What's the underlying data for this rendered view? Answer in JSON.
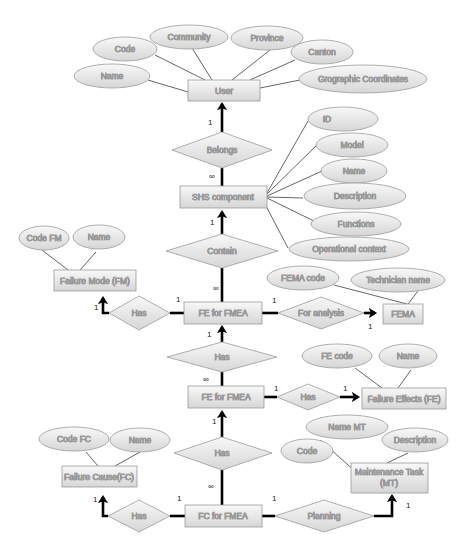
{
  "diagram": {
    "type": "entity-relationship",
    "colors": {
      "fill_top": "#f7f7f7",
      "fill_bottom": "#d9d9d9",
      "stroke": "#9a9a9a",
      "line": "#555555",
      "thick_line": "#000000"
    },
    "entities": {
      "user": "User",
      "shs_component": "SHS component",
      "failure_mode": "Failure Mode (FM)",
      "fe_for_fmea_1": "FE for FMEA",
      "fema": "FEMA",
      "fe_for_fmea_2": "FE for FMEA",
      "failure_effects": "Failure Effects (FE)",
      "failure_cause": "Failure Cause(FC)",
      "fc_for_fmea": "FC for FMEA",
      "maintenance_task_line1": "Maintenance Task",
      "maintenance_task_line2": "(MT)"
    },
    "relationships": {
      "belongs": "Belongs",
      "contain": "Contain",
      "has_fm": "Has",
      "for_analysis": "For analysis",
      "has_fe_mid": "Has",
      "has_fe": "Has",
      "has_fc_mid": "Has",
      "has_fc": "Has",
      "planning": "Planning"
    },
    "attributes": {
      "user": {
        "code": "Code",
        "community": "Community",
        "province": "Province",
        "canton": "Canton",
        "name": "Name",
        "coords": "Grographic Coordinates"
      },
      "shs": {
        "id": "ID",
        "model": "Model",
        "name": "Name",
        "description": "Description",
        "functions": "Functions",
        "operational_context": "Operational context"
      },
      "fm": {
        "code": "Code FM",
        "name": "Name"
      },
      "fema": {
        "code": "FEMA code",
        "technician": "Technician name"
      },
      "fe": {
        "code": "FE code",
        "name": "Name"
      },
      "fc": {
        "code": "Code FC",
        "name": "Name"
      },
      "mt": {
        "name": "Name MT",
        "description": "Description",
        "code": "Code"
      }
    },
    "cardinalities": {
      "user_belongs": "1",
      "belongs_shs": "∞",
      "shs_contain": "1",
      "contain_fe1": "∞",
      "fe1_has_fm_left": "1",
      "fe1_has_fm_right": "1",
      "fe1_for_analysis": "1",
      "for_analysis_fema": "1",
      "fe1_has_mid": "1",
      "has_mid_fe2": "∞",
      "fe2_has": "1",
      "has_fe": "1",
      "fe2_has_fc_mid": "1",
      "has_fc_mid_fc": "∞",
      "fc_has_left": "1",
      "fc_has_right": "1",
      "fc_planning": "1",
      "planning_mt": "1"
    }
  }
}
